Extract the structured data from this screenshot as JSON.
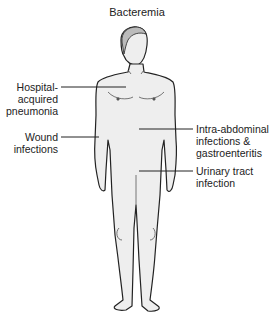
{
  "title": "Bacteremia",
  "labels": {
    "hospital": [
      "Hospital-",
      "acquired",
      "pneumonia"
    ],
    "wound": [
      "Wound",
      "infections"
    ],
    "intra": [
      "Intra-abdominal",
      "infections &",
      "gastroenteritis"
    ],
    "urinary": [
      "Urinary tract",
      "infection"
    ]
  }
}
